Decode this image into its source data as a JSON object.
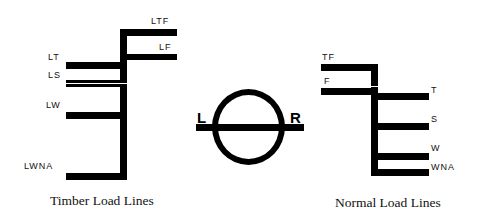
{
  "timber": {
    "caption": "Timber Load Lines",
    "labels": {
      "ltf": "LTF",
      "lf": "LF",
      "lt": "LT",
      "ls": "LS",
      "lw": "LW",
      "lwna": "LWNA"
    }
  },
  "plimsoll": {
    "left_label": "L",
    "right_label": "R"
  },
  "normal": {
    "caption": "Normal Load Lines",
    "labels": {
      "tf": "TF",
      "f": "F",
      "t": "T",
      "s": "S",
      "w": "W",
      "wna": "WNA"
    }
  }
}
